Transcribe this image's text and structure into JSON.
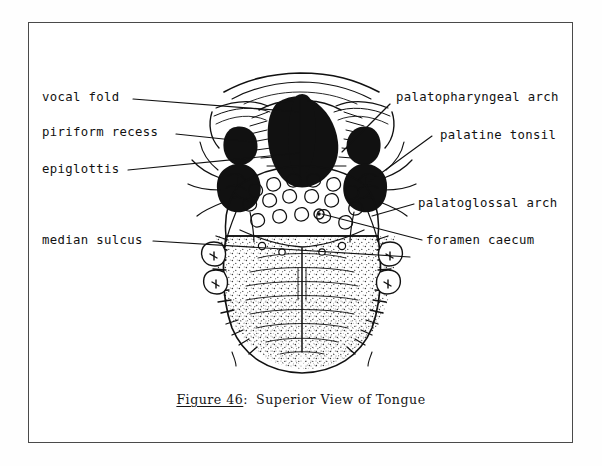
{
  "figure": {
    "title_prefix": "Figure 46",
    "title_separator": ":",
    "title_text": "Superior View of Tongue"
  },
  "labels": {
    "left": [
      {
        "id": "vocal-fold",
        "text": "vocal fold"
      },
      {
        "id": "piriform-recess",
        "text": "piriform recess"
      },
      {
        "id": "epiglottis",
        "text": "epiglottis"
      },
      {
        "id": "median-sulcus",
        "text": "median sulcus"
      }
    ],
    "right": [
      {
        "id": "palatopharyngeal-arch",
        "text": "palatopharyngeal arch"
      },
      {
        "id": "palatine-tonsil",
        "text": "palatine tonsil"
      },
      {
        "id": "palatoglossal-arch",
        "text": "palatoglossal arch"
      },
      {
        "id": "foramen-caecum",
        "text": "foramen caecum"
      }
    ]
  },
  "colors": {
    "ink": "#111111",
    "frame": "#4a4a4a",
    "paper": "#ffffff"
  }
}
